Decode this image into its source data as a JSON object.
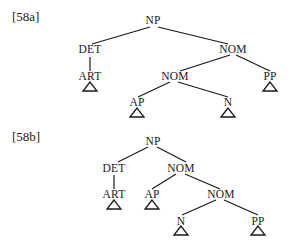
{
  "trees": [
    {
      "label": "[58a]",
      "nodes": {
        "root": "NP",
        "det": "DET",
        "nom1": "NOM",
        "art": "ART",
        "nom2": "NOM",
        "pp": "PP",
        "ap": "AP",
        "n": "N"
      }
    },
    {
      "label": "[58b]",
      "nodes": {
        "root": "NP",
        "det": "DET",
        "nom1": "NOM",
        "art": "ART",
        "ap": "AP",
        "nom2": "NOM",
        "n": "N",
        "pp": "PP"
      }
    }
  ]
}
